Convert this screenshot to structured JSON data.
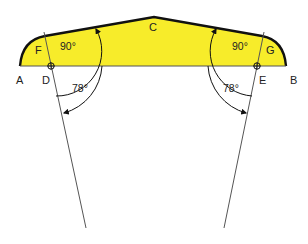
{
  "diagram": {
    "title": "",
    "colors": {
      "fill": "#f7ec2a",
      "outline": "#111111",
      "lines": "#555555",
      "text": "#222222",
      "background": "#ffffff"
    },
    "points": [
      {
        "id": "A",
        "label": "A"
      },
      {
        "id": "B",
        "label": "B"
      },
      {
        "id": "C",
        "label": "C"
      },
      {
        "id": "D",
        "label": "D"
      },
      {
        "id": "E",
        "label": "E"
      },
      {
        "id": "F",
        "label": "F"
      },
      {
        "id": "G",
        "label": "G"
      }
    ],
    "angles": {
      "left_right_angle": "90°",
      "right_right_angle": "90°",
      "left_angle": "78°",
      "right_angle": "78°"
    }
  }
}
